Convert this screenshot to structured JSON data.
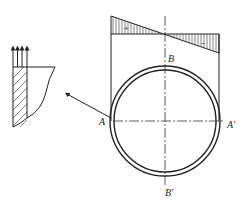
{
  "diagram": {
    "type": "pipe cross-section with bending stress distribution",
    "labels": {
      "A": "A",
      "A_prime": "A'",
      "B": "B",
      "B_prime": "B'"
    },
    "stress_diagram": {
      "positive_sign": "+",
      "negative_sign": "−"
    },
    "detail": {
      "arrow_count": 4
    },
    "colors": {
      "line": "#222222",
      "background": "#ffffff"
    }
  }
}
